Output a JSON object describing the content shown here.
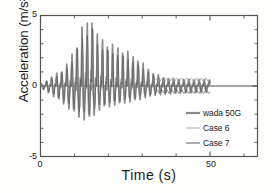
{
  "chart_data": {
    "type": "line",
    "title": "",
    "xlabel": "Time  (s)",
    "ylabel": "Acceleration  (m/s²)",
    "xlim": [
      0,
      64
    ],
    "ylim": [
      -5,
      5
    ],
    "xticks": [
      0,
      50
    ],
    "xtick_labels": [
      "0",
      "50"
    ],
    "yticks": [
      5,
      0,
      -5
    ],
    "ytick_labels": [
      "5",
      "0",
      "-5"
    ],
    "grid": false,
    "legend_position": "lower-right-inside",
    "series": [
      {
        "name": "wada 50G",
        "color": "#8a8a8a",
        "width": 1.6,
        "description": "Measured record: amplitude grows from near zero at t=0 to a maximum spike of about 5 m/s^2 near t=16 s, then decays; after t~37 s it oscillates with amplitude under 0.5 m/s^2 until t=50 s.",
        "x": [
          0,
          1,
          2,
          3,
          4,
          5,
          6,
          7,
          8,
          9,
          10,
          11,
          12,
          13,
          14,
          15,
          16,
          17,
          18,
          19,
          20,
          21,
          22,
          23,
          24,
          25,
          26,
          27,
          28,
          29,
          30,
          31,
          32,
          33,
          34,
          35,
          36,
          37,
          38,
          39,
          40,
          41,
          42,
          43,
          44,
          45,
          46,
          47,
          48,
          49,
          50
        ],
        "peak_envelope_positive": [
          0.1,
          0.25,
          0.4,
          0.55,
          0.7,
          0.85,
          1.0,
          1.2,
          1.5,
          1.9,
          2.4,
          3.0,
          3.6,
          4.3,
          4.1,
          4.9,
          3.6,
          3.3,
          3.1,
          2.9,
          2.8,
          2.7,
          2.6,
          2.5,
          2.4,
          2.3,
          2.2,
          2.0,
          1.9,
          1.7,
          1.5,
          1.3,
          1.1,
          0.9,
          0.8,
          0.7,
          0.6,
          0.55,
          0.5,
          0.5,
          0.48,
          0.46,
          0.45,
          0.45,
          0.44,
          0.44,
          0.43,
          0.43,
          0.42,
          0.42,
          0.42
        ],
        "peak_envelope_negative": [
          -0.1,
          -0.25,
          -0.4,
          -0.55,
          -0.7,
          -0.85,
          -1.0,
          -1.2,
          -1.4,
          -1.6,
          -1.8,
          -2.0,
          -2.1,
          -2.2,
          -2.1,
          -2.3,
          -1.8,
          -1.6,
          -1.5,
          -1.4,
          -1.35,
          -1.3,
          -1.25,
          -1.2,
          -1.15,
          -1.1,
          -1.05,
          -1.0,
          -0.95,
          -0.9,
          -0.8,
          -0.75,
          -0.7,
          -0.65,
          -0.6,
          -0.58,
          -0.55,
          -0.53,
          -0.5,
          -0.5,
          -0.48,
          -0.47,
          -0.46,
          -0.45,
          -0.45,
          -0.44,
          -0.44,
          -0.43,
          -0.43,
          -0.42,
          -0.42
        ]
      },
      {
        "name": "Case 6",
        "color": "#9b9b9b",
        "width": 0.8,
        "description": "Simulation: follows the measured envelope, settling to a steady oscillation around +0.5 m/s^2 after t~38 s, ending at t=50 s."
      },
      {
        "name": "Case 7",
        "color": "#5a5a5a",
        "width": 0.8,
        "description": "Simulation: follows the measured envelope, settling to a steady oscillation around -0.4 m/s^2 after t~38 s, ending at t=50 s."
      }
    ],
    "notes": [
      "Dominant oscillation period is roughly 1.5 s, producing sharp narrow positive spikes.",
      "A near-zero dark baseline trace continues past t=50 s to the right frame edge."
    ]
  },
  "legend": {
    "items": [
      {
        "label": "wada 50G"
      },
      {
        "label": "Case 6"
      },
      {
        "label": "Case 7"
      }
    ]
  },
  "axes": {
    "x_label": "Time  (s)",
    "y_label": "Acceleration  (m/s²)",
    "x_tick_labels": [
      "0",
      "50"
    ],
    "y_tick_labels": [
      "5",
      "0",
      "-5"
    ]
  }
}
